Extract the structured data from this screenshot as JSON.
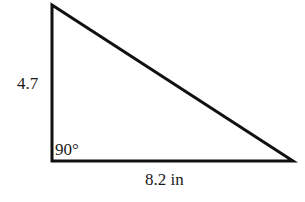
{
  "diagram": {
    "type": "right-triangle",
    "vertices": {
      "top": [
        52,
        5
      ],
      "right_angle": [
        52,
        161
      ],
      "right": [
        293,
        161
      ]
    },
    "labels": {
      "vertical_leg": "4.7",
      "horizontal_leg": "8.2 in",
      "right_angle": "90°"
    },
    "stroke_color": "#111111",
    "stroke_width": 3
  }
}
